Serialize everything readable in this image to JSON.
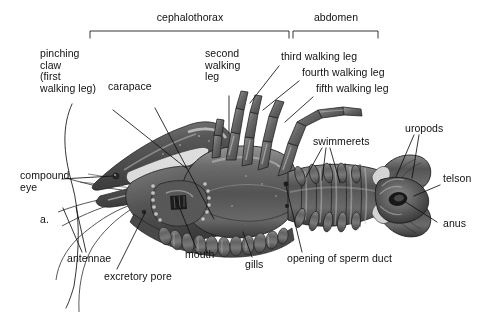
{
  "figure": {
    "panel_label": "a.",
    "organism": "crayfish ventral anatomy diagram",
    "background": "#ffffff",
    "ink": "#101010"
  },
  "brackets": [
    {
      "id": "cephalothorax",
      "label": "cephalothorax",
      "x1": 90,
      "x2": 289,
      "y": 31,
      "label_x": 190,
      "label_y": 12
    },
    {
      "id": "abdomen",
      "label": "abdomen",
      "x1": 293,
      "x2": 378,
      "y": 31,
      "label_x": 336,
      "label_y": 12
    }
  ],
  "labels": {
    "pinching_claw": "pinching\nclaw\n(first\nwalking leg)",
    "carapace": "carapace",
    "second_walking_leg": "second\nwalking\nleg",
    "third_walking_leg": "third walking leg",
    "fourth_walking_leg": "fourth walking leg",
    "fifth_walking_leg": "fifth walking leg",
    "swimmerets": "swimmerets",
    "uropods": "uropods",
    "telson": "telson",
    "anus": "anus",
    "opening_of_sperm_duct": "opening of sperm duct",
    "gills": "gills",
    "mouth": "mouth",
    "excretory_pore": "excretory pore",
    "antennae": "antennae",
    "compound_eye": "compound\neye",
    "panel": "a."
  },
  "leader_lines": [
    {
      "name": "pinching-claw-leader",
      "points": "72,104 63,124 64,152 73,186 80,212 80,248 74,286 66,306"
    },
    {
      "name": "carapace-leader",
      "points": "113,110 186,168"
    },
    {
      "name": "carapace-leader-2",
      "points": "155,108 214,219"
    },
    {
      "name": "second-walking-leg-leader",
      "points": "229,96 229,133"
    },
    {
      "name": "third-walking-leg-leader",
      "points": "279,66 250,103"
    },
    {
      "name": "fourth-walking-leg-leader",
      "points": "299,81 263,110"
    },
    {
      "name": "fifth-walking-leg-leader",
      "points": "313,97 284,123"
    },
    {
      "name": "swimmerets-leader-a",
      "points": "322,148 307,177"
    },
    {
      "name": "swimmerets-leader-b",
      "points": "325,148 322,180"
    },
    {
      "name": "swimmerets-leader-c",
      "points": "329,148 339,182"
    },
    {
      "name": "uropods-leader-a",
      "points": "413,135 397,177"
    },
    {
      "name": "uropods-leader-b",
      "points": "418,135 412,178"
    },
    {
      "name": "telson-leader",
      "points": "440,185 414,196"
    },
    {
      "name": "anus-leader",
      "points": "438,222 406,201"
    },
    {
      "name": "sperm-duct-leader",
      "points": "302,252 286,184"
    },
    {
      "name": "gills-leader",
      "points": "252,257 243,232"
    },
    {
      "name": "mouth-leader",
      "points": "196,248 176,198"
    },
    {
      "name": "excretory-pore-leader",
      "points": "117,269 144,212"
    },
    {
      "name": "antennae-leader-a",
      "points": "82,252 63,208"
    },
    {
      "name": "antennae-leader-b",
      "points": "85,252 74,207"
    },
    {
      "name": "compound-eye-leader",
      "points": "62,179 114,176"
    }
  ]
}
